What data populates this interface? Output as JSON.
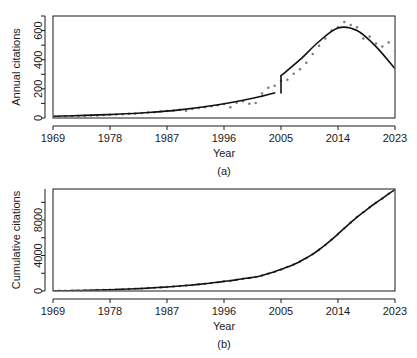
{
  "figure": {
    "panels": [
      {
        "id": "a",
        "panel_label": "(a)",
        "xlabel": "Year",
        "ylabel": "Annual citations"
      },
      {
        "id": "b",
        "panel_label": "(b)",
        "xlabel": "Year",
        "ylabel": "Cumulative citations"
      }
    ]
  },
  "chart_data": [
    {
      "type": "scatter",
      "title": "",
      "panel": "(a)",
      "xlabel": "Year",
      "ylabel": "Annual citations",
      "xlim": [
        1969,
        2023
      ],
      "ylim": [
        0,
        700
      ],
      "xticks": [
        1969,
        1978,
        1987,
        1996,
        2005,
        2014,
        2023
      ],
      "xticklabels": [
        "1969",
        "1978",
        "1987",
        "1996",
        "2005",
        "2014",
        "2023"
      ],
      "yticks": [
        0,
        200,
        400,
        600
      ],
      "yticklabels": [
        "0",
        "200",
        "400",
        "600"
      ],
      "yminorticks": [
        100,
        300,
        500,
        700
      ],
      "grid": false,
      "legend": null,
      "x": [
        1969,
        1970,
        1971,
        1972,
        1973,
        1974,
        1975,
        1976,
        1977,
        1978,
        1979,
        1980,
        1981,
        1982,
        1983,
        1984,
        1985,
        1986,
        1987,
        1988,
        1989,
        1990,
        1991,
        1992,
        1993,
        1994,
        1995,
        1996,
        1997,
        1998,
        1999,
        2000,
        2001,
        2002,
        2003,
        2004,
        2005,
        2006,
        2007,
        2008,
        2009,
        2010,
        2011,
        2012,
        2013,
        2014,
        2015,
        2016,
        2017,
        2018,
        2019,
        2020,
        2021,
        2022,
        2023
      ],
      "values": [
        8,
        9,
        11,
        12,
        14,
        15,
        17,
        18,
        20,
        22,
        24,
        26,
        29,
        31,
        34,
        37,
        40,
        44,
        48,
        52,
        57,
        50,
        62,
        68,
        74,
        81,
        88,
        96,
        74,
        105,
        115,
        97,
        103,
        168,
        208,
        222,
        255,
        262,
        303,
        335,
        380,
        440,
        496,
        545,
        600,
        622,
        658,
        638,
        622,
        545,
        560,
        512,
        490,
        518,
        460
      ],
      "series": [
        {
          "name": "Annual citations (observed)",
          "type": "scatter",
          "marker": "point",
          "color": "#7a7a7a",
          "values": [
            8,
            9,
            11,
            12,
            14,
            15,
            17,
            18,
            20,
            22,
            24,
            26,
            29,
            31,
            34,
            37,
            40,
            44,
            48,
            52,
            57,
            50,
            62,
            68,
            74,
            81,
            88,
            96,
            74,
            105,
            115,
            97,
            103,
            168,
            208,
            222,
            255,
            262,
            303,
            335,
            380,
            440,
            496,
            545,
            600,
            622,
            658,
            638,
            622,
            545,
            560,
            512,
            490,
            518,
            460
          ]
        },
        {
          "name": "Fitted trend (segmented, break at 2005)",
          "type": "line",
          "color": "#111111",
          "breakpoint_year": 2005,
          "segment1_x": [
            1969,
            1974,
            1979,
            1984,
            1989,
            1994,
            1999,
            2002,
            2004
          ],
          "segment1_y": [
            12,
            18,
            26,
            38,
            56,
            84,
            122,
            150,
            172
          ],
          "segment2_x": [
            2005,
            2008,
            2011,
            2014,
            2017,
            2020,
            2023
          ],
          "segment2_y": [
            290,
            400,
            525,
            618,
            600,
            490,
            338
          ]
        }
      ],
      "annotations": [
        {
          "text": "discontinuity in fitted line at 2005",
          "x": 2005,
          "y": 230
        }
      ]
    },
    {
      "type": "scatter",
      "title": "",
      "panel": "(b)",
      "xlabel": "Year",
      "ylabel": "Cumulative citations",
      "xlim": [
        1969,
        2023
      ],
      "ylim": [
        0,
        11500
      ],
      "xticks": [
        1969,
        1978,
        1987,
        1996,
        2005,
        2014,
        2023
      ],
      "xticklabels": [
        "1969",
        "1978",
        "1987",
        "1996",
        "2005",
        "2014",
        "2023"
      ],
      "yticks": [
        0,
        4000,
        8000
      ],
      "yticklabels": [
        "0",
        "4000",
        "8000"
      ],
      "yminorticks": [
        2000,
        6000,
        10000
      ],
      "grid": false,
      "legend": null,
      "x": [
        1969,
        1970,
        1971,
        1972,
        1973,
        1974,
        1975,
        1976,
        1977,
        1978,
        1979,
        1980,
        1981,
        1982,
        1983,
        1984,
        1985,
        1986,
        1987,
        1988,
        1989,
        1990,
        1991,
        1992,
        1993,
        1994,
        1995,
        1996,
        1997,
        1998,
        1999,
        2000,
        2001,
        2002,
        2003,
        2004,
        2005,
        2006,
        2007,
        2008,
        2009,
        2010,
        2011,
        2012,
        2013,
        2014,
        2015,
        2016,
        2017,
        2018,
        2019,
        2020,
        2021,
        2022,
        2023
      ],
      "values": [
        8,
        17,
        28,
        40,
        54,
        69,
        86,
        104,
        124,
        146,
        170,
        196,
        225,
        256,
        290,
        327,
        367,
        411,
        459,
        511,
        568,
        618,
        680,
        748,
        822,
        903,
        991,
        1087,
        1161,
        1266,
        1381,
        1478,
        1581,
        1749,
        1957,
        2179,
        2434,
        2696,
        2999,
        3334,
        3714,
        4154,
        4650,
        5195,
        5795,
        6417,
        7075,
        7713,
        8335,
        8880,
        9440,
        9952,
        10442,
        10960,
        11420
      ],
      "series": [
        {
          "name": "Cumulative citations (observed)",
          "type": "scatter",
          "marker": "point",
          "color": "#7a7a7a"
        },
        {
          "name": "Cumulative fitted curve",
          "type": "line",
          "color": "#111111"
        }
      ]
    }
  ]
}
